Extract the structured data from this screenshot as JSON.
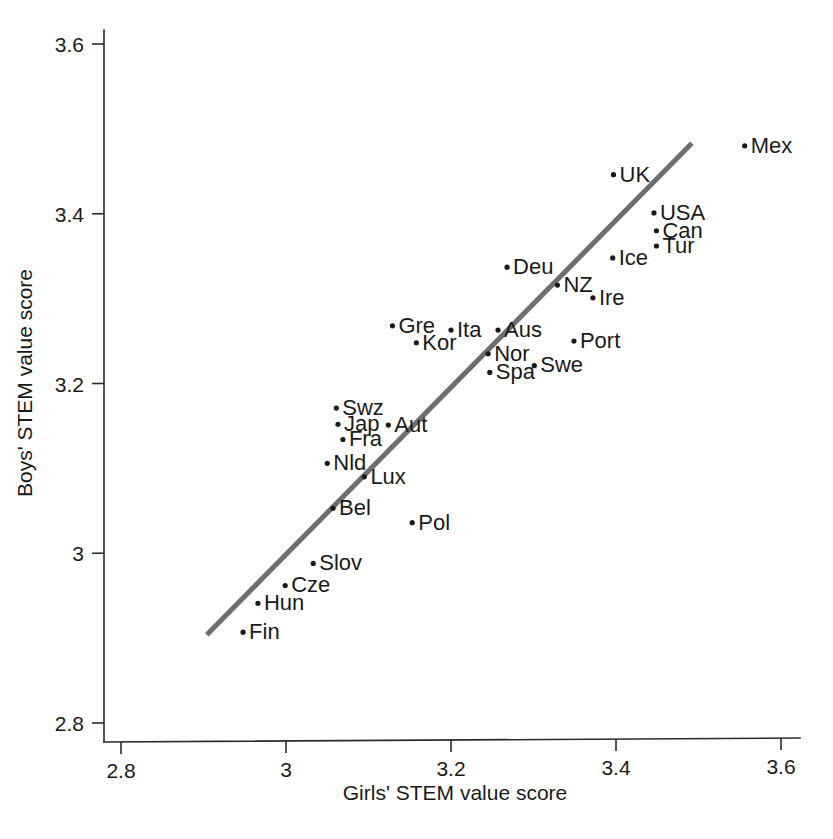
{
  "chart_data": {
    "type": "scatter",
    "title": "",
    "xlabel": "Girls' STEM value score",
    "ylabel": "Boys' STEM value score",
    "xlim": [
      2.72,
      3.66
    ],
    "ylim": [
      2.78,
      3.64
    ],
    "xticks": [
      "2.8",
      "3",
      "3.2",
      "3.4",
      "3.6"
    ],
    "xtick_values": [
      2.8,
      3.0,
      3.2,
      3.4,
      3.6
    ],
    "yticks": [
      "2.8",
      "3",
      "3.2",
      "3.4",
      "3.6"
    ],
    "ytick_values": [
      2.8,
      3.0,
      3.2,
      3.4,
      3.6
    ],
    "grid": false,
    "legend": "none",
    "marker": "small-dot",
    "point_label_position": "right-of-marker",
    "series": [
      {
        "name": "OECD countries",
        "points": [
          {
            "label": "Mex",
            "x": 3.556,
            "y": 3.48
          },
          {
            "label": "UK",
            "x": 3.397,
            "y": 3.446
          },
          {
            "label": "USA",
            "x": 3.446,
            "y": 3.401
          },
          {
            "label": "Can",
            "x": 3.449,
            "y": 3.38
          },
          {
            "label": "Tur",
            "x": 3.449,
            "y": 3.362
          },
          {
            "label": "Ice",
            "x": 3.396,
            "y": 3.348
          },
          {
            "label": "Deu",
            "x": 3.268,
            "y": 3.337
          },
          {
            "label": "NZ",
            "x": 3.329,
            "y": 3.316
          },
          {
            "label": "Ire",
            "x": 3.372,
            "y": 3.301
          },
          {
            "label": "Gre",
            "x": 3.129,
            "y": 3.268
          },
          {
            "label": "Ita",
            "x": 3.2,
            "y": 3.263
          },
          {
            "label": "Aus",
            "x": 3.257,
            "y": 3.263
          },
          {
            "label": "Kor",
            "x": 3.158,
            "y": 3.248
          },
          {
            "label": "Port",
            "x": 3.349,
            "y": 3.25
          },
          {
            "label": "Nor",
            "x": 3.245,
            "y": 3.235
          },
          {
            "label": "Swe",
            "x": 3.301,
            "y": 3.221
          },
          {
            "label": "Spa",
            "x": 3.247,
            "y": 3.213
          },
          {
            "label": "Swz",
            "x": 3.061,
            "y": 3.171
          },
          {
            "label": "Jap",
            "x": 3.063,
            "y": 3.152
          },
          {
            "label": "Aut",
            "x": 3.124,
            "y": 3.151
          },
          {
            "label": "Fra",
            "x": 3.069,
            "y": 3.134
          },
          {
            "label": "Nld",
            "x": 3.05,
            "y": 3.106
          },
          {
            "label": "Lux",
            "x": 3.095,
            "y": 3.09
          },
          {
            "label": "Bel",
            "x": 3.057,
            "y": 3.053
          },
          {
            "label": "Pol",
            "x": 3.153,
            "y": 3.036
          },
          {
            "label": "Slov",
            "x": 3.033,
            "y": 2.988
          },
          {
            "label": "Cze",
            "x": 2.999,
            "y": 2.962
          },
          {
            "label": "Hun",
            "x": 2.966,
            "y": 2.941
          },
          {
            "label": "Fin",
            "x": 2.948,
            "y": 2.907
          }
        ]
      }
    ],
    "fit_line": {
      "name": "linear fit",
      "color": "#6e6e6e",
      "x_start": 2.904,
      "y_start": 2.904,
      "x_end": 3.492,
      "y_end": 3.483
    }
  },
  "colors": {
    "fit_line": "#6e6e6e",
    "marker": "#1a1a1a",
    "axis": "#2b2b2b",
    "text": "#1a1a1a",
    "background": "#ffffff"
  }
}
